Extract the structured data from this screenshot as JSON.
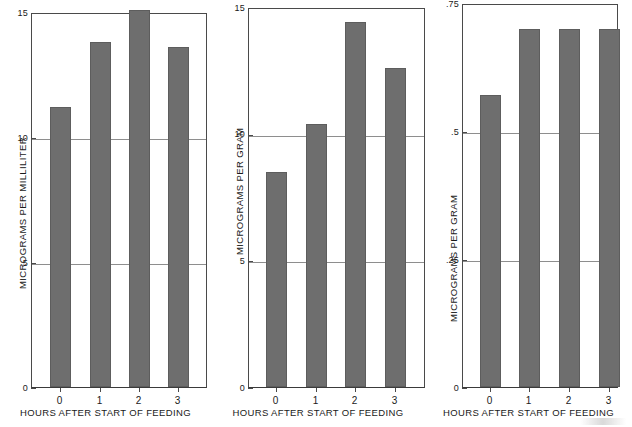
{
  "figure": {
    "background": "#ffffff",
    "bar_color": "#6e6e6e",
    "axis_color": "#4a4a4a",
    "grid_color": "#8e8e8e"
  },
  "panels": [
    {
      "id": "panel-0",
      "ylabel": "MICROGRAMS PER MILLILITER",
      "xlabel": "HOURS AFTER START OF FEEDING",
      "yticks": [
        "0",
        "5",
        "10",
        "15"
      ],
      "xticks": [
        "0",
        "1",
        "2",
        "3"
      ]
    },
    {
      "id": "panel-1",
      "ylabel": "MICROGRAMS PER GRAM",
      "xlabel": "HOURS AFTER START OF FEEDING",
      "yticks": [
        "0",
        "5",
        "10",
        "15"
      ],
      "xticks": [
        "0",
        "1",
        "2",
        "3"
      ]
    },
    {
      "id": "panel-2",
      "ylabel": "MICROGRAMS PER GRAM",
      "xlabel": "HOURS AFTER START OF FEEDING",
      "yticks": [
        "0",
        ".25",
        ".5",
        ".75"
      ],
      "xticks": [
        "0",
        "1",
        "2",
        "3"
      ]
    }
  ],
  "chart_data": [
    {
      "type": "bar",
      "title": "",
      "xlabel": "HOURS AFTER START OF FEEDING",
      "ylabel": "MICROGRAMS PER MILLILITER",
      "categories": [
        "0",
        "1",
        "2",
        "3"
      ],
      "values": [
        11.2,
        13.8,
        15.1,
        13.6
      ],
      "ylim": [
        0,
        15
      ],
      "ytick_values": [
        0,
        5,
        10,
        15
      ],
      "ytick_labels": [
        "0",
        "5",
        "10",
        "15"
      ],
      "grid": "horizontal-at-yticks",
      "legend": "none"
    },
    {
      "type": "bar",
      "title": "",
      "xlabel": "HOURS AFTER START OF FEEDING",
      "ylabel": "MICROGRAMS PER GRAM",
      "categories": [
        "0",
        "1",
        "2",
        "3"
      ],
      "values": [
        8.5,
        10.4,
        14.4,
        12.6
      ],
      "ylim": [
        0,
        15
      ],
      "ytick_values": [
        0,
        5,
        10,
        15
      ],
      "ytick_labels": [
        "0",
        "5",
        "10",
        "15"
      ],
      "grid": "horizontal-at-yticks",
      "legend": "none"
    },
    {
      "type": "bar",
      "title": "",
      "xlabel": "HOURS AFTER START OF FEEDING",
      "ylabel": "MICROGRAMS PER GRAM",
      "categories": [
        "0",
        "1",
        "2",
        "3"
      ],
      "values": [
        0.57,
        0.7,
        0.7,
        0.7
      ],
      "ylim": [
        0,
        0.75
      ],
      "ytick_values": [
        0,
        0.25,
        0.5,
        0.75
      ],
      "ytick_labels": [
        "0",
        ".25",
        ".5",
        ".75"
      ],
      "grid": "horizontal-at-yticks",
      "legend": "none"
    }
  ]
}
